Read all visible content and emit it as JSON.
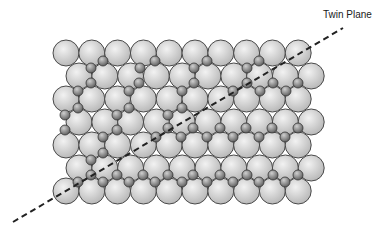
{
  "labels": {
    "twin_plane": "Twin Plane"
  },
  "colors": {
    "host_fill_light": "#f2f2f2",
    "host_fill_dark": "#b5b5b5",
    "host_stroke": "#4a4a4a",
    "solute_fill_light": "#cfcfcf",
    "solute_fill_dark": "#5e5e5e",
    "solute_stroke": "#333333",
    "twin_line": "#222222"
  },
  "lattice": {
    "host_radius": 13,
    "solute_radius": 5,
    "rows": [
      {
        "y": 53,
        "x0": 66,
        "count": 10
      },
      {
        "y": 76,
        "x0": 79,
        "count": 10
      },
      {
        "y": 99,
        "x0": 66,
        "count": 10
      },
      {
        "y": 122,
        "x0": 79,
        "count": 10
      },
      {
        "y": 145,
        "x0": 66,
        "count": 10
      },
      {
        "y": 168,
        "x0": 79,
        "count": 10
      },
      {
        "y": 191,
        "x0": 66,
        "count": 10
      }
    ],
    "spacing": 25.8
  },
  "solutes": [
    [
      103,
      61
    ],
    [
      91,
      68
    ],
    [
      91,
      83
    ],
    [
      78,
      91
    ],
    [
      155,
      61
    ],
    [
      140,
      68
    ],
    [
      139,
      83
    ],
    [
      129,
      91
    ],
    [
      207,
      61
    ],
    [
      194,
      68
    ],
    [
      194,
      83
    ],
    [
      182,
      91
    ],
    [
      259,
      61
    ],
    [
      247,
      68
    ],
    [
      247,
      83
    ],
    [
      233,
      91
    ],
    [
      260,
      91
    ],
    [
      273,
      83
    ],
    [
      286,
      91
    ],
    [
      298,
      83
    ],
    [
      78,
      108
    ],
    [
      65,
      115
    ],
    [
      65,
      130
    ],
    [
      129,
      108
    ],
    [
      117,
      115
    ],
    [
      117,
      130
    ],
    [
      103,
      137
    ],
    [
      182,
      108
    ],
    [
      168,
      115
    ],
    [
      168,
      128
    ],
    [
      156,
      137
    ],
    [
      193,
      128
    ],
    [
      181,
      137
    ],
    [
      220,
      128
    ],
    [
      207,
      137
    ],
    [
      246,
      128
    ],
    [
      233,
      137
    ],
    [
      272,
      128
    ],
    [
      259,
      137
    ],
    [
      298,
      128
    ],
    [
      285,
      137
    ],
    [
      103,
      153
    ],
    [
      91,
      160
    ],
    [
      91,
      175
    ],
    [
      78,
      182
    ],
    [
      103,
      182
    ],
    [
      117,
      175
    ],
    [
      129,
      182
    ],
    [
      143,
      175
    ],
    [
      155,
      182
    ],
    [
      168,
      175
    ],
    [
      182,
      182
    ],
    [
      193,
      175
    ],
    [
      207,
      182
    ],
    [
      220,
      175
    ],
    [
      233,
      182
    ],
    [
      247,
      175
    ],
    [
      259,
      182
    ],
    [
      273,
      175
    ],
    [
      285,
      182
    ],
    [
      298,
      175
    ]
  ],
  "twin_plane_line": {
    "x1": 13,
    "y1": 222,
    "x2": 343,
    "y2": 28,
    "dash": "6,4",
    "width": 2
  },
  "label_position": {
    "x": 323,
    "y": 9
  }
}
